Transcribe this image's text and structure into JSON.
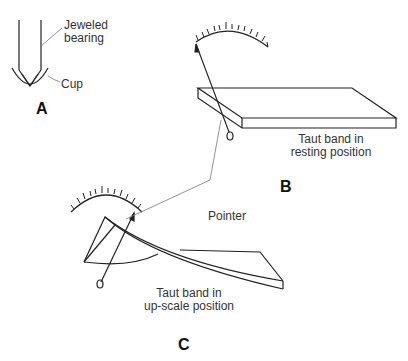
{
  "diagram": {
    "panels": [
      {
        "id": "A",
        "label": "A",
        "callouts": [
          "Jeweled bearing",
          "Cup"
        ]
      },
      {
        "id": "B",
        "label": "B",
        "caption_line1": "Taut band in",
        "caption_line2": "resting position"
      },
      {
        "id": "C",
        "label": "C",
        "caption_line1": "Taut band in",
        "caption_line2": "up-scale position"
      }
    ],
    "shared_callout": "Pointer"
  },
  "labels": {
    "jeweled_line1": "Jeweled",
    "jeweled_line2": "bearing",
    "cup": "Cup",
    "panel_a": "A",
    "panel_b": "B",
    "panel_c": "C",
    "pointer": "Pointer",
    "b_caption_1": "Taut band in",
    "b_caption_2": "resting position",
    "c_caption_1": "Taut band in",
    "c_caption_2": "up-scale position"
  },
  "colors": {
    "stroke": "#222222",
    "leader": "#777777",
    "text": "#333333"
  }
}
